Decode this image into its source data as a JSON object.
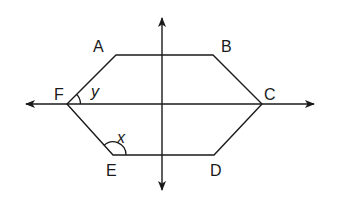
{
  "diagram": {
    "type": "hexagon-with-axes",
    "colors": {
      "stroke": "#1a1a1a",
      "background": "#ffffff"
    },
    "vertices": [
      {
        "label": "A",
        "x": 116,
        "y": 55
      },
      {
        "label": "B",
        "x": 213,
        "y": 55
      },
      {
        "label": "C",
        "x": 262,
        "y": 104
      },
      {
        "label": "D",
        "x": 214,
        "y": 155
      },
      {
        "label": "E",
        "x": 113,
        "y": 155
      },
      {
        "label": "F",
        "x": 67,
        "y": 104
      }
    ],
    "labels": {
      "A": "A",
      "B": "B",
      "C": "C",
      "D": "D",
      "E": "E",
      "F": "F"
    },
    "angles": {
      "x": {
        "label": "x",
        "vertex": "E"
      },
      "y": {
        "label": "y",
        "vertex": "F"
      }
    },
    "axes": {
      "horizontal": {
        "y": 104,
        "x_start": 26,
        "x_end": 314,
        "arrows": "both"
      },
      "vertical": {
        "x": 162,
        "y_start": 18,
        "y_end": 190,
        "arrows": "both"
      }
    }
  }
}
